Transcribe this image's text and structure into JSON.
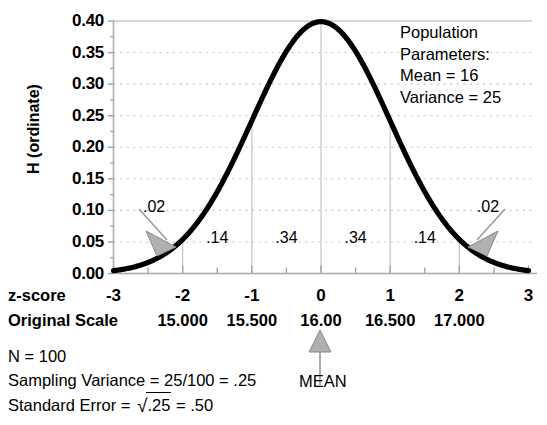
{
  "chart_data": {
    "type": "line",
    "title": "",
    "xlabel": "z-score",
    "ylabel": "H (ordinate)",
    "xlim": [
      -3,
      3
    ],
    "ylim": [
      0.0,
      0.4
    ],
    "grid": true,
    "curve": "standard normal density",
    "x": [
      -3,
      -2.5,
      -2,
      -1.5,
      -1,
      -0.5,
      0,
      0.5,
      1,
      1.5,
      2,
      2.5,
      3
    ],
    "values": [
      0.0044,
      0.0175,
      0.054,
      0.1295,
      0.242,
      0.3521,
      0.3989,
      0.3521,
      0.242,
      0.1295,
      0.054,
      0.0175,
      0.0044
    ],
    "y_ticks": [
      "0.00",
      "0.05",
      "0.10",
      "0.15",
      "0.20",
      "0.25",
      "0.30",
      "0.35",
      "0.40"
    ],
    "x_ticks": [
      "-3",
      "-2",
      "-1",
      "0",
      "1",
      "2",
      "3"
    ],
    "original_scale_ticks": [
      {
        "z": -2,
        "label": "15.000"
      },
      {
        "z": -1,
        "label": "15.500"
      },
      {
        "z": 0,
        "label": "16.00"
      },
      {
        "z": 1,
        "label": "16.500"
      },
      {
        "z": 2,
        "label": "17.000"
      }
    ],
    "proportions": [
      {
        "z": -2.5,
        "label": ".02",
        "callout": true
      },
      {
        "z": -1.5,
        "label": ".14",
        "callout": false
      },
      {
        "z": -0.5,
        "label": ".34",
        "callout": false
      },
      {
        "z": 0.5,
        "label": ".34",
        "callout": false
      },
      {
        "z": 1.5,
        "label": ".14",
        "callout": false
      },
      {
        "z": 2.5,
        "label": ".02",
        "callout": true
      }
    ],
    "annotations": [
      "Population",
      "Parameters:",
      "Mean = 16",
      "Variance = 25"
    ],
    "mean_marker_label": "MEAN",
    "notes": [
      "N = 100",
      "Sampling Variance = 25/100 = .25"
    ],
    "standard_error": {
      "prefix": "Standard Error = ",
      "radicand": ".25",
      "suffix": " = .50"
    },
    "colors": {
      "curve": "#000000",
      "gridline": "#c8c8c8",
      "axis": "#b4b4b4",
      "arrow_fill": "#a8a8a8",
      "text": "#000000"
    }
  },
  "axis_rows": {
    "zscore_label": "z-score",
    "original_scale_label": "Original Scale"
  }
}
